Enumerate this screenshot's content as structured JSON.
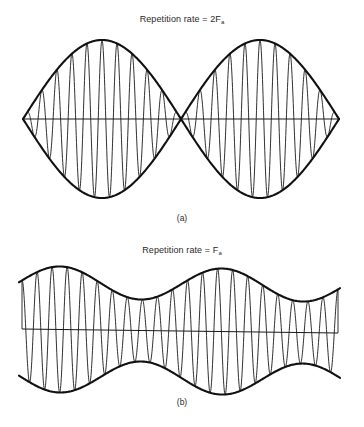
{
  "figure": {
    "panel_a": {
      "title_text": "Repetition rate = 2F",
      "title_subscript": "a",
      "caption": "(a)",
      "description": "Double-sideband suppressed-carrier waveform: carrier whose envelope is |cos|, forming two lobes that cross at zero",
      "geometry": {
        "x_start": 23,
        "x_cross": 181,
        "x_end": 339,
        "baseline_y": 119,
        "amplitude": 79,
        "carrier_cycles_per_lobe": 10.5
      }
    },
    "panel_b": {
      "title_text": "Repetition rate = F",
      "title_subscript": "a",
      "caption": "(b)",
      "description": "Amplitude-modulated waveform with carrier present: envelope varies between maxima and minima without reaching zero",
      "geometry": {
        "x_start": 22,
        "x_end": 338,
        "baseline_y_left": 329,
        "baseline_y_right": 333,
        "carrier_cycles": 21,
        "envelope_max_amplitude": 63,
        "envelope_min_amplitude": 31
      }
    },
    "colors": {
      "ink": "#111111",
      "background": "#ffffff"
    }
  }
}
